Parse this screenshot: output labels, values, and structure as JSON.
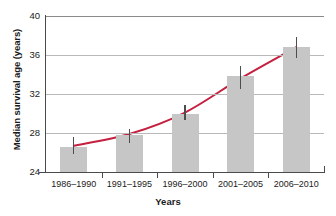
{
  "chart_data": {
    "type": "bar",
    "title": "",
    "xlabel": "Years",
    "ylabel": "Median survival age (years)",
    "categories": [
      "1986–1990",
      "1991–1995",
      "1996–2000",
      "2001–2005",
      "2006–2010"
    ],
    "values": [
      26.6,
      27.8,
      30.0,
      33.8,
      36.8
    ],
    "error_low": [
      25.8,
      27.0,
      29.3,
      32.5,
      35.7
    ],
    "error_high": [
      27.6,
      28.4,
      30.9,
      34.9,
      37.8
    ],
    "series": [
      {
        "name": "Median survival age",
        "type": "bar",
        "values": [
          26.6,
          27.8,
          30.0,
          33.8,
          36.8
        ]
      },
      {
        "name": "Trend line",
        "type": "line",
        "color": "#c4203f",
        "values": [
          26.7,
          27.9,
          30.1,
          33.6,
          36.8
        ]
      }
    ],
    "ylim": [
      24,
      40
    ],
    "yticks": [
      24,
      28,
      32,
      36,
      40
    ],
    "ytick_labels": [
      "24",
      "28",
      "32",
      "36",
      "40"
    ],
    "grid": true,
    "grid_axis": "y",
    "legend": "none",
    "bar_color": "#c6c6c6",
    "error_bar_color": "#4d4d4d",
    "trend_color": "#c4203f",
    "axis_color": "#4a4a4a",
    "gridline_color": "#b9b9b9",
    "background": "#ffffff"
  }
}
